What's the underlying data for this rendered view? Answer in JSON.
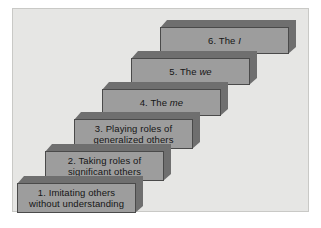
{
  "diagram": {
    "background_color": "#e6e6e4",
    "frame_border_color": "#c9c9c6",
    "step_face_color": "#9d9d9d",
    "step_bevel_color": "#6f6f6f",
    "step_outline_color": "#4a4a4a",
    "text_color": "#151515",
    "steps": [
      {
        "id": "step-1",
        "number": "1.",
        "label": "1. Imitating others\nwithout understanding",
        "line1": "1. Imitating others",
        "line2": "without understanding",
        "emphasis": "",
        "left": 16,
        "top": 175,
        "width": 126,
        "height": 37
      },
      {
        "id": "step-2",
        "number": "2.",
        "label": "2. Taking roles of\nsignificant others",
        "line1": "2. Taking roles of",
        "line2": "significant others",
        "emphasis": "",
        "left": 44,
        "top": 143,
        "width": 126,
        "height": 37
      },
      {
        "id": "step-3",
        "number": "3.",
        "label": "3. Playing roles of\ngeneralized others",
        "line1": "3. Playing roles of",
        "line2": "generalized others",
        "emphasis": "",
        "left": 73,
        "top": 111,
        "width": 126,
        "height": 37
      },
      {
        "id": "step-4",
        "number": "4.",
        "label": "4. The me",
        "line1": "4. The ",
        "line2": "",
        "emphasis": "me",
        "left": 101,
        "top": 81,
        "width": 126,
        "height": 34
      },
      {
        "id": "step-5",
        "number": "5.",
        "label": "5. The we",
        "line1": "5. The ",
        "line2": "",
        "emphasis": "we",
        "left": 130,
        "top": 50,
        "width": 126,
        "height": 34
      },
      {
        "id": "step-6",
        "number": "6.",
        "label": "6. The I",
        "line1": "6. The ",
        "line2": "",
        "emphasis": "I",
        "left": 159,
        "top": 19,
        "width": 136,
        "height": 34
      }
    ]
  }
}
